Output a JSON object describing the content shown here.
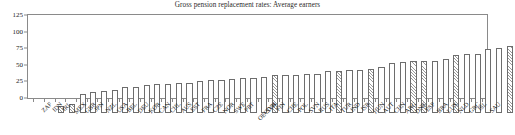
{
  "chart_data": {
    "type": "bar",
    "title": "Gross pension replacement rates: Average earners",
    "xlabel": "",
    "ylabel": "",
    "ylim": [
      0,
      125
    ],
    "yticks": [
      0,
      25,
      50,
      75,
      100,
      125
    ],
    "grid": false,
    "legend": "none",
    "categories": [
      "ZAF",
      "IDN",
      "IRL",
      "MEX",
      "GBR",
      "JPN",
      "NZL",
      "USA",
      "BEL",
      "DEU",
      "KOR",
      "CAN",
      "CHL",
      "AUS",
      "EST",
      "FRA",
      "CZE",
      "NOR",
      "SWE",
      "PRT",
      "OECD34",
      "SVK",
      "FIN",
      "CHE",
      "POL",
      "SVN",
      "RUS",
      "ITA",
      "TUR",
      "IND",
      "ISR",
      "HUN",
      "AUT",
      "CHN",
      "ARG",
      "DNK",
      "ESP",
      "BRA",
      "LUX",
      "NLD",
      "GRC",
      "ISL",
      "SAU"
    ],
    "values": [
      10,
      14,
      29,
      31,
      33,
      35,
      39,
      39,
      42,
      43,
      43,
      45,
      45,
      48,
      49,
      50,
      51,
      53,
      53,
      54,
      58,
      58,
      58,
      59,
      59,
      64,
      64,
      65,
      65,
      66,
      70,
      75,
      77,
      78,
      78,
      79,
      82,
      87,
      89,
      89,
      97,
      98,
      101
    ],
    "series_styles": [
      "hatched",
      "hatched",
      "plain",
      "plain",
      "plain",
      "plain",
      "plain",
      "plain",
      "plain",
      "plain",
      "plain",
      "plain",
      "plain",
      "plain",
      "plain",
      "plain",
      "plain",
      "plain",
      "plain",
      "plain",
      "hatched",
      "plain",
      "plain",
      "plain",
      "plain",
      "plain",
      "hatched",
      "plain",
      "plain",
      "hatched",
      "plain",
      "plain",
      "plain",
      "hatched",
      "hatched",
      "plain",
      "plain",
      "hatched",
      "plain",
      "plain",
      "plain",
      "plain",
      "hatched"
    ],
    "style_legend": {
      "plain": "OECD member country",
      "hatched": "Non-OECD economy or OECD average"
    },
    "colors": {
      "bar_outline": "#6d6d6d",
      "bar_fill": "#ffffff",
      "hatch": "#9a9a9a",
      "axis": "#8a8a8a",
      "text": "#1a1a1a",
      "title": "#2b2b2b"
    }
  }
}
